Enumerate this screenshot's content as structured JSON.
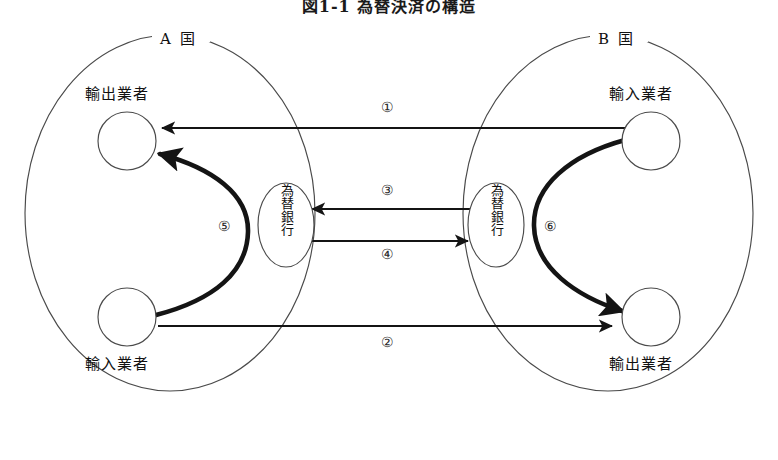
{
  "figure": {
    "title": "図1-1 為替決済の構造"
  },
  "countries": [
    {
      "id": "country-a",
      "label": "A 国"
    },
    {
      "id": "country-b",
      "label": "B 国"
    }
  ],
  "actors": [
    {
      "id": "a-exporter",
      "label": "輸出業者"
    },
    {
      "id": "a-importer",
      "label": "輸入業者"
    },
    {
      "id": "b-importer",
      "label": "輸入業者"
    },
    {
      "id": "b-exporter",
      "label": "輸出業者"
    }
  ],
  "banks": [
    {
      "id": "bank-a",
      "label": "為替銀行"
    },
    {
      "id": "bank-b",
      "label": "為替銀行"
    }
  ],
  "flows": [
    {
      "id": "flow-1",
      "marker": "①",
      "from": "b-importer",
      "to": "a-exporter",
      "style": "thin"
    },
    {
      "id": "flow-2",
      "marker": "②",
      "from": "a-importer",
      "to": "b-exporter",
      "style": "thin"
    },
    {
      "id": "flow-3",
      "marker": "③",
      "from": "bank-b",
      "to": "bank-a",
      "style": "thin"
    },
    {
      "id": "flow-4",
      "marker": "④",
      "from": "bank-a",
      "to": "bank-b",
      "style": "thin"
    },
    {
      "id": "flow-5",
      "marker": "⑤",
      "from": "a-importer",
      "to": "a-exporter",
      "style": "thick"
    },
    {
      "id": "flow-6",
      "marker": "⑥",
      "from": "b-importer",
      "to": "b-exporter",
      "style": "thick"
    }
  ],
  "colors": {
    "stroke": "#1a1a1a",
    "outline": "#444444",
    "background": "#ffffff"
  }
}
